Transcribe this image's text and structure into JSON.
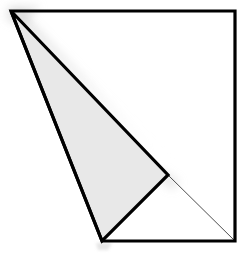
{
  "canvas": {
    "width": 249,
    "height": 254,
    "background_color": "#ffffff"
  },
  "figure": {
    "name": "shaded-triangle-in-quadrilateral",
    "stroke_color": "#000000",
    "stroke_width": 3.2,
    "hairline_color": "#3a3a3a",
    "hairline_width": 0.9,
    "fill_color": "#e8e8e8",
    "shadow_color": "#c9c9c9"
  },
  "points": {
    "apex": {
      "label": "apex",
      "x": 11,
      "y": 11
    },
    "top_right": {
      "label": "top-right",
      "x": 235,
      "y": 11
    },
    "bottom_right": {
      "label": "bottom-right",
      "x": 235,
      "y": 241
    },
    "bottom_vertex": {
      "label": "bottom-vertex",
      "x": 102,
      "y": 241
    },
    "mid_right": {
      "label": "mid-right",
      "x": 168,
      "y": 175
    }
  },
  "shapes": {
    "outer_quadrilateral": {
      "label": "outer-quadrilateral",
      "points": "11,11 235,11 235,241 102,241",
      "fill": "none"
    },
    "shaded_triangle": {
      "label": "shaded-triangle",
      "points": "11,11 168,175 102,241",
      "fill": "#e8e8e8"
    },
    "diagonal_hairline": {
      "label": "diagonal-hairline",
      "x1": 168,
      "y1": 175,
      "x2": 235,
      "y2": 241
    }
  }
}
